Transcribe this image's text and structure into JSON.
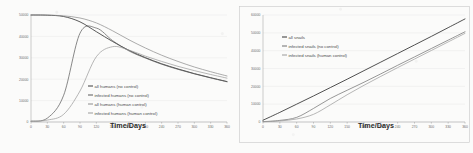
{
  "figure": {
    "background_color": "#fbfbfa",
    "panel_count": 2
  },
  "chart_data": [
    {
      "type": "line",
      "title": "",
      "xlabel": "Time/Days",
      "ylabel": "",
      "xlim": [
        0,
        360
      ],
      "ylim": [
        0,
        50000
      ],
      "grid": true,
      "legend_position": "center",
      "xticks": [
        0,
        30,
        60,
        90,
        120,
        150,
        180,
        210,
        240,
        270,
        300,
        330,
        360
      ],
      "yticks": [
        0,
        10000,
        20000,
        30000,
        40000,
        50000
      ],
      "ytick_labels": [
        "0",
        "10000",
        "20000",
        "30000",
        "40000",
        "50000"
      ],
      "x": [
        0,
        30,
        60,
        90,
        120,
        150,
        180,
        210,
        240,
        270,
        300,
        330,
        360
      ],
      "series": [
        {
          "name": "all humans (no control)",
          "color": "#3d3d3d",
          "values": [
            50000,
            49900,
            49300,
            46800,
            42200,
            37600,
            33500,
            30100,
            27200,
            24800,
            22600,
            20700,
            18900
          ]
        },
        {
          "name": "infected humans (no control)",
          "color": "#5a5a5a",
          "values": [
            400,
            1800,
            12500,
            41500,
            43900,
            38000,
            33200,
            29900,
            27000,
            24600,
            22500,
            20600,
            18800
          ]
        },
        {
          "name": "all humans (human control)",
          "color": "#8c8c8c",
          "values": [
            50000,
            49950,
            49600,
            48600,
            46300,
            42600,
            38400,
            34600,
            31200,
            28300,
            25700,
            23500,
            21500
          ]
        },
        {
          "name": "infected humans (human control)",
          "color": "#9b9b9b",
          "values": [
            300,
            900,
            3600,
            14500,
            30500,
            35200,
            33600,
            30800,
            28300,
            26000,
            24000,
            22200,
            20500
          ]
        }
      ]
    },
    {
      "type": "line",
      "title": "",
      "xlabel": "Time/Days",
      "ylabel": "",
      "xlim": [
        0,
        360
      ],
      "ylim": [
        0,
        60000
      ],
      "grid": true,
      "legend_position": "upper left",
      "xticks": [
        0,
        30,
        60,
        90,
        120,
        150,
        180,
        210,
        240,
        270,
        300,
        330,
        360
      ],
      "yticks": [
        0,
        10000,
        20000,
        30000,
        40000,
        50000,
        60000
      ],
      "ytick_labels": [
        "0",
        "10000",
        "20000",
        "30000",
        "40000",
        "50000",
        "60000"
      ],
      "x": [
        0,
        30,
        60,
        90,
        120,
        150,
        180,
        210,
        240,
        270,
        300,
        330,
        360
      ],
      "series": [
        {
          "name": "all snails",
          "color": "#333333",
          "values": [
            1000,
            5400,
            10000,
            14600,
            19300,
            24000,
            28800,
            33600,
            38400,
            43200,
            48000,
            52900,
            57800
          ]
        },
        {
          "name": "infected snails (no control)",
          "color": "#6f6f6f",
          "values": [
            200,
            900,
            2600,
            7600,
            13200,
            17800,
            22300,
            27000,
            31800,
            36500,
            41200,
            45900,
            50600
          ]
        },
        {
          "name": "infected snails (human control)",
          "color": "#9a9a9a",
          "values": [
            150,
            600,
            1700,
            4300,
            9600,
            15300,
            20600,
            25600,
            30500,
            35300,
            40100,
            44900,
            49700
          ]
        }
      ]
    }
  ]
}
